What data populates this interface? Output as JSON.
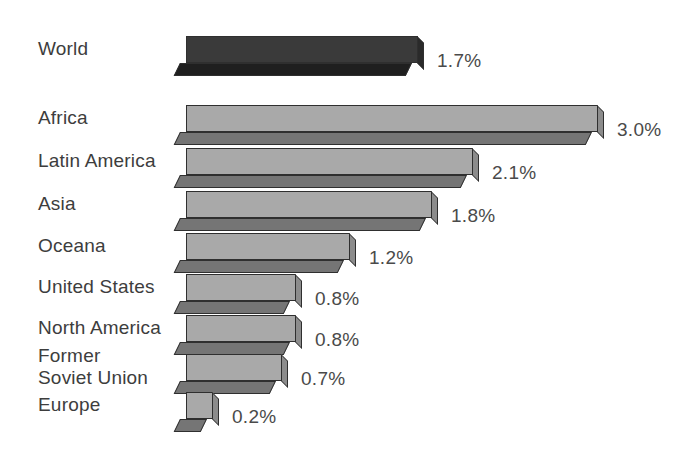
{
  "chart_data": {
    "type": "bar",
    "title": "",
    "subtitle": "",
    "xlabel": "",
    "ylabel": "",
    "orientation": "horizontal",
    "grid": false,
    "legend": "none",
    "axis_visible": false,
    "value_suffix": "%",
    "xlim": [
      0,
      3.0
    ],
    "categories": [
      "World",
      "Africa",
      "Latin America",
      "Asia",
      "Oceana",
      "United States",
      "North America",
      "Former\nSoviet Union",
      "Europe"
    ],
    "values": [
      1.7,
      3.0,
      2.1,
      1.8,
      1.2,
      0.8,
      0.8,
      0.7,
      0.2
    ],
    "value_labels": [
      "1.7%",
      "3.0%",
      "2.1%",
      "1.8%",
      "1.2%",
      "0.8%",
      "0.8%",
      "0.7%",
      "0.2%"
    ],
    "series": [
      {
        "name": "Annual growth rate",
        "values": [
          1.7,
          3.0,
          2.1,
          1.8,
          1.2,
          0.8,
          0.8,
          0.7,
          0.2
        ]
      }
    ],
    "bars": [
      {
        "label": "World",
        "value": 1.7,
        "value_label": "1.7%",
        "highlight": true,
        "top": 36,
        "bar_left": 186,
        "bar_width": 232,
        "bar_height": 27,
        "depth": 13
      },
      {
        "label": "Africa",
        "value": 3.0,
        "value_label": "3.0%",
        "highlight": false,
        "top": 105,
        "bar_left": 186,
        "bar_width": 412,
        "bar_height": 27,
        "depth": 13
      },
      {
        "label": "Latin America",
        "value": 2.1,
        "value_label": "2.1%",
        "highlight": false,
        "top": 148,
        "bar_left": 186,
        "bar_width": 287,
        "bar_height": 27,
        "depth": 13
      },
      {
        "label": "Asia",
        "value": 1.8,
        "value_label": "1.8%",
        "highlight": false,
        "top": 191,
        "bar_left": 186,
        "bar_width": 246,
        "bar_height": 27,
        "depth": 13
      },
      {
        "label": "Oceana",
        "value": 1.2,
        "value_label": "1.2%",
        "highlight": false,
        "top": 233,
        "bar_left": 186,
        "bar_width": 164,
        "bar_height": 27,
        "depth": 13
      },
      {
        "label": "United States",
        "value": 0.8,
        "value_label": "0.8%",
        "highlight": false,
        "top": 274,
        "bar_left": 186,
        "bar_width": 110,
        "bar_height": 27,
        "depth": 13
      },
      {
        "label": "North America",
        "value": 0.8,
        "value_label": "0.8%",
        "highlight": false,
        "top": 315,
        "bar_left": 186,
        "bar_width": 110,
        "bar_height": 27,
        "depth": 13
      },
      {
        "label": "Former\nSoviet Union",
        "value": 0.7,
        "value_label": "0.7%",
        "highlight": false,
        "top": 354,
        "bar_left": 186,
        "bar_width": 96,
        "bar_height": 27,
        "depth": 13
      },
      {
        "label": "Europe",
        "value": 0.2,
        "value_label": "0.2%",
        "highlight": false,
        "top": 392,
        "bar_left": 186,
        "bar_width": 27,
        "bar_height": 27,
        "depth": 13
      }
    ]
  },
  "style": {
    "background": "#ffffff",
    "bar_top_color": "#a9a9a9",
    "bar_shade_color": "#757575",
    "bar_side_color": "#8c8c8c",
    "bar_outline_color": "#2f2f2f",
    "highlight_top_color": "#3a3a3a",
    "highlight_shade_color": "#1f1f1f",
    "highlight_side_color": "#2a2a2a",
    "label_color": "#3d3d3d",
    "value_color": "#4a4a4a"
  }
}
